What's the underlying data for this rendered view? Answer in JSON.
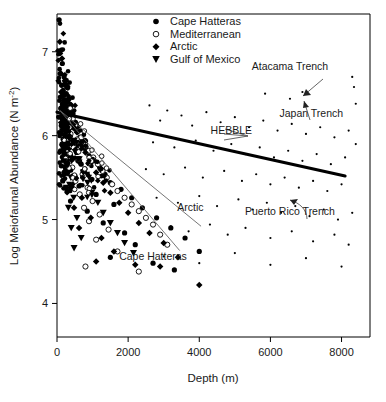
{
  "chart_data": {
    "type": "scatter",
    "title": "",
    "xlabel": "Depth (m)",
    "ylabel": "Log Meiofaunal Abundance (N m-2)",
    "ylabel_display": "Log Meiofaunal Abundance (N m⁻²)",
    "xlim": [
      0,
      8800
    ],
    "ylim": [
      3.6,
      7.45
    ],
    "xticks": [
      0,
      2000,
      4000,
      6000,
      8000
    ],
    "xticklabels": [
      "0",
      "2000",
      "4000",
      "6000",
      "8000"
    ],
    "yticks": [
      4,
      5,
      6,
      7
    ],
    "yticklabels": [
      "4",
      "5",
      "6",
      "7"
    ],
    "grid": false,
    "legend_position": "top-center",
    "legend": [
      {
        "label": "Cape Hatteras",
        "marker": "filled-circle"
      },
      {
        "label": "Mediterranean",
        "marker": "open-circle"
      },
      {
        "label": "Arctic",
        "marker": "filled-diamond"
      },
      {
        "label": "Gulf of Mexico",
        "marker": "filled-triangle-down"
      }
    ],
    "annotations": [
      {
        "text": "Atacama Trench",
        "x": 6550,
        "y": 6.78
      },
      {
        "text": "Japan Trench",
        "x": 7150,
        "y": 6.22
      },
      {
        "text": "HEBBLE",
        "x": 4900,
        "y": 6.02
      },
      {
        "text": "Puerto Rico Trench",
        "x": 6550,
        "y": 5.05
      },
      {
        "text": "Arctic",
        "x": 3750,
        "y": 5.1
      },
      {
        "text": "Cape Hatteras",
        "x": 2700,
        "y": 4.52
      }
    ],
    "fit_lines": [
      {
        "name": "all-data-regression",
        "style": "thick",
        "x": [
          0,
          8100
        ],
        "y": [
          6.28,
          5.52
        ]
      },
      {
        "name": "arctic-regression",
        "style": "thin",
        "x": [
          80,
          4050
        ],
        "y": [
          6.3,
          4.92
        ]
      },
      {
        "name": "cape-hatteras-regression",
        "style": "thin",
        "x": [
          80,
          3450
        ],
        "y": [
          6.3,
          4.63
        ]
      }
    ],
    "series": [
      {
        "name": "Cape Hatteras",
        "marker": "filled-circle",
        "points": [
          [
            60,
            7.38
          ],
          [
            120,
            7.02
          ],
          [
            150,
            6.86
          ],
          [
            90,
            6.74
          ],
          [
            200,
            6.7
          ],
          [
            240,
            6.66
          ],
          [
            130,
            6.6
          ],
          [
            300,
            6.58
          ],
          [
            175,
            6.54
          ],
          [
            260,
            6.5
          ],
          [
            95,
            6.46
          ],
          [
            340,
            6.44
          ],
          [
            210,
            6.42
          ],
          [
            150,
            6.38
          ],
          [
            400,
            6.36
          ],
          [
            280,
            6.34
          ],
          [
            110,
            6.32
          ],
          [
            330,
            6.3
          ],
          [
            190,
            6.28
          ],
          [
            450,
            6.26
          ],
          [
            240,
            6.24
          ],
          [
            70,
            6.22
          ],
          [
            360,
            6.2
          ],
          [
            160,
            6.18
          ],
          [
            520,
            6.16
          ],
          [
            290,
            6.14
          ],
          [
            120,
            6.12
          ],
          [
            420,
            6.1
          ],
          [
            200,
            6.08
          ],
          [
            580,
            6.06
          ],
          [
            260,
            6.04
          ],
          [
            90,
            6.02
          ],
          [
            380,
            6.0
          ],
          [
            640,
            5.98
          ],
          [
            170,
            5.96
          ],
          [
            310,
            5.94
          ],
          [
            720,
            5.92
          ],
          [
            140,
            5.9
          ],
          [
            480,
            5.88
          ],
          [
            230,
            5.86
          ],
          [
            800,
            5.84
          ],
          [
            100,
            5.82
          ],
          [
            560,
            5.8
          ],
          [
            280,
            5.78
          ],
          [
            900,
            5.76
          ],
          [
            180,
            5.74
          ],
          [
            430,
            5.72
          ],
          [
            1050,
            5.7
          ],
          [
            250,
            5.68
          ],
          [
            680,
            5.66
          ],
          [
            120,
            5.64
          ],
          [
            1200,
            5.62
          ],
          [
            340,
            5.6
          ],
          [
            760,
            5.58
          ],
          [
            200,
            5.56
          ],
          [
            1350,
            5.54
          ],
          [
            450,
            5.52
          ],
          [
            980,
            5.48
          ],
          [
            160,
            5.46
          ],
          [
            1500,
            5.44
          ],
          [
            620,
            5.4
          ],
          [
            1800,
            5.36
          ],
          [
            280,
            5.34
          ],
          [
            1100,
            5.3
          ],
          [
            2100,
            5.26
          ],
          [
            380,
            5.22
          ],
          [
            1600,
            5.18
          ],
          [
            2400,
            5.14
          ],
          [
            850,
            5.1
          ],
          [
            2800,
            5.02
          ],
          [
            1300,
            4.96
          ],
          [
            3200,
            4.9
          ],
          [
            1900,
            4.84
          ],
          [
            3600,
            4.78
          ],
          [
            2200,
            4.7
          ],
          [
            4000,
            4.62
          ],
          [
            1500,
            4.55
          ],
          [
            2700,
            4.48
          ],
          [
            3300,
            4.4
          ]
        ],
        "comment": "dense inshore cluster plus declining deep points"
      },
      {
        "name": "Mediterranean",
        "marker": "open-circle",
        "points": [
          [
            300,
            6.22
          ],
          [
            420,
            6.16
          ],
          [
            250,
            6.1
          ],
          [
            550,
            6.06
          ],
          [
            380,
            6.02
          ],
          [
            680,
            5.98
          ],
          [
            310,
            5.94
          ],
          [
            790,
            5.9
          ],
          [
            470,
            5.86
          ],
          [
            900,
            5.82
          ],
          [
            350,
            5.78
          ],
          [
            1020,
            5.74
          ],
          [
            600,
            5.7
          ],
          [
            1150,
            5.66
          ],
          [
            430,
            5.62
          ],
          [
            1280,
            5.58
          ],
          [
            720,
            5.54
          ],
          [
            1400,
            5.5
          ],
          [
            520,
            5.46
          ],
          [
            1550,
            5.42
          ],
          [
            860,
            5.38
          ],
          [
            1700,
            5.34
          ],
          [
            640,
            5.3
          ],
          [
            1900,
            5.26
          ],
          [
            1000,
            5.22
          ],
          [
            2100,
            5.18
          ],
          [
            760,
            5.14
          ],
          [
            2300,
            5.1
          ],
          [
            1200,
            5.06
          ],
          [
            2500,
            5.02
          ],
          [
            900,
            4.98
          ],
          [
            2700,
            4.94
          ],
          [
            1450,
            4.88
          ],
          [
            2900,
            4.82
          ],
          [
            1100,
            4.76
          ],
          [
            3100,
            4.7
          ],
          [
            1700,
            4.62
          ],
          [
            800,
            4.44
          ],
          [
            2300,
            4.38
          ]
        ]
      },
      {
        "name": "Arctic",
        "marker": "filled-diamond",
        "points": [
          [
            80,
            7.12
          ],
          [
            140,
            6.92
          ],
          [
            110,
            6.74
          ],
          [
            220,
            6.62
          ],
          [
            170,
            6.48
          ],
          [
            300,
            6.4
          ],
          [
            130,
            6.34
          ],
          [
            380,
            6.28
          ],
          [
            250,
            6.22
          ],
          [
            460,
            6.16
          ],
          [
            190,
            6.1
          ],
          [
            560,
            6.04
          ],
          [
            330,
            5.98
          ],
          [
            680,
            5.92
          ],
          [
            240,
            5.86
          ],
          [
            800,
            5.8
          ],
          [
            420,
            5.74
          ],
          [
            950,
            5.68
          ],
          [
            300,
            5.62
          ],
          [
            1100,
            5.56
          ],
          [
            520,
            5.5
          ],
          [
            1300,
            5.44
          ],
          [
            380,
            5.38
          ],
          [
            1500,
            5.32
          ],
          [
            700,
            5.26
          ],
          [
            1750,
            5.2
          ],
          [
            480,
            5.14
          ],
          [
            2000,
            5.08
          ],
          [
            950,
            5.02
          ],
          [
            2300,
            4.96
          ],
          [
            620,
            4.9
          ],
          [
            2600,
            4.84
          ],
          [
            1250,
            4.78
          ],
          [
            3000,
            4.72
          ],
          [
            1600,
            4.62
          ],
          [
            3400,
            4.55
          ],
          [
            2200,
            4.46
          ],
          [
            4000,
            4.22
          ],
          [
            1100,
            4.5
          ],
          [
            2900,
            4.44
          ]
        ]
      },
      {
        "name": "Gulf of Mexico",
        "marker": "filled-triangle-down",
        "points": [
          [
            120,
            6.3
          ],
          [
            260,
            6.22
          ],
          [
            180,
            6.14
          ],
          [
            340,
            6.06
          ],
          [
            230,
            5.98
          ],
          [
            430,
            5.92
          ],
          [
            150,
            5.86
          ],
          [
            520,
            5.8
          ],
          [
            300,
            5.74
          ],
          [
            620,
            5.68
          ],
          [
            200,
            5.62
          ],
          [
            740,
            5.56
          ],
          [
            390,
            5.5
          ],
          [
            860,
            5.44
          ],
          [
            260,
            5.38
          ],
          [
            980,
            5.32
          ],
          [
            470,
            5.26
          ],
          [
            1150,
            5.2
          ],
          [
            320,
            5.14
          ],
          [
            1300,
            5.08
          ],
          [
            560,
            5.02
          ],
          [
            1500,
            4.96
          ],
          [
            400,
            4.9
          ],
          [
            1700,
            4.84
          ],
          [
            680,
            4.78
          ],
          [
            1900,
            4.72
          ],
          [
            480,
            4.66
          ],
          [
            2150,
            4.6
          ]
        ]
      },
      {
        "name": "deep-scattered-small-points",
        "marker": "small-dot",
        "points": [
          [
            2600,
            6.36
          ],
          [
            3100,
            6.3
          ],
          [
            2900,
            6.18
          ],
          [
            3500,
            6.24
          ],
          [
            3800,
            6.12
          ],
          [
            4200,
            6.28
          ],
          [
            4600,
            6.16
          ],
          [
            5000,
            6.22
          ],
          [
            5400,
            6.1
          ],
          [
            5800,
            6.18
          ],
          [
            6200,
            6.06
          ],
          [
            6600,
            6.14
          ],
          [
            7000,
            6.02
          ],
          [
            7400,
            6.1
          ],
          [
            7800,
            5.98
          ],
          [
            8200,
            6.06
          ],
          [
            2700,
            5.92
          ],
          [
            3300,
            5.86
          ],
          [
            3900,
            5.94
          ],
          [
            4400,
            5.82
          ],
          [
            4900,
            5.9
          ],
          [
            5300,
            5.78
          ],
          [
            5700,
            5.86
          ],
          [
            6100,
            5.74
          ],
          [
            6500,
            5.82
          ],
          [
            6900,
            5.7
          ],
          [
            7300,
            5.78
          ],
          [
            7700,
            5.66
          ],
          [
            8100,
            5.74
          ],
          [
            2500,
            5.6
          ],
          [
            3000,
            5.54
          ],
          [
            3600,
            5.62
          ],
          [
            4100,
            5.5
          ],
          [
            4700,
            5.58
          ],
          [
            5200,
            5.46
          ],
          [
            5600,
            5.54
          ],
          [
            6000,
            5.42
          ],
          [
            6400,
            5.5
          ],
          [
            6800,
            5.38
          ],
          [
            7200,
            5.46
          ],
          [
            7600,
            5.34
          ],
          [
            8000,
            5.42
          ],
          [
            2800,
            5.26
          ],
          [
            3400,
            5.2
          ],
          [
            4000,
            5.28
          ],
          [
            4500,
            5.16
          ],
          [
            5100,
            5.24
          ],
          [
            5500,
            5.12
          ],
          [
            5900,
            5.2
          ],
          [
            6300,
            5.08
          ],
          [
            6700,
            5.16
          ],
          [
            7100,
            5.04
          ],
          [
            7500,
            5.12
          ],
          [
            7900,
            5.0
          ],
          [
            8300,
            5.08
          ],
          [
            3200,
            4.92
          ],
          [
            3700,
            4.86
          ],
          [
            4300,
            4.94
          ],
          [
            4800,
            4.82
          ],
          [
            5300,
            4.9
          ],
          [
            6000,
            4.78
          ],
          [
            6600,
            4.86
          ],
          [
            7200,
            4.74
          ],
          [
            7800,
            4.82
          ],
          [
            8200,
            4.7
          ],
          [
            3000,
            4.56
          ],
          [
            4000,
            4.48
          ],
          [
            5000,
            4.6
          ],
          [
            6000,
            4.46
          ],
          [
            7000,
            4.54
          ],
          [
            8000,
            4.44
          ],
          [
            8400,
            6.38
          ],
          [
            8400,
            5.9
          ],
          [
            8350,
            6.58
          ],
          [
            8300,
            6.7
          ]
        ]
      },
      {
        "name": "trench-highlighted-points",
        "marker": "small-dot",
        "points": [
          [
            5850,
            6.5
          ],
          [
            6550,
            6.44
          ],
          [
            6900,
            6.52
          ]
        ]
      }
    ]
  },
  "figure": {
    "axis_color": "#000000",
    "point_color": "#000000",
    "fit_main_color": "#000000",
    "fit_thin_color": "#666666",
    "background": "#ffffff"
  }
}
